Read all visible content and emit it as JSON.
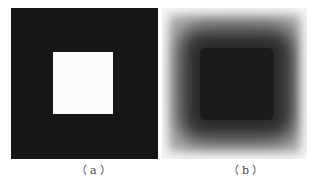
{
  "figure": {
    "panels": [
      {
        "id": "a",
        "label": "（a）",
        "description": "Binary image: white square centered on black background",
        "background_color": "#161616",
        "square_color": "#fbfbfb"
      },
      {
        "id": "b",
        "label": "（b）",
        "description": "Blurred image: dark square core fading to light gray/white at edges",
        "core_color": "#1c1c1c",
        "edge_color": "#f2f2f2"
      }
    ]
  }
}
